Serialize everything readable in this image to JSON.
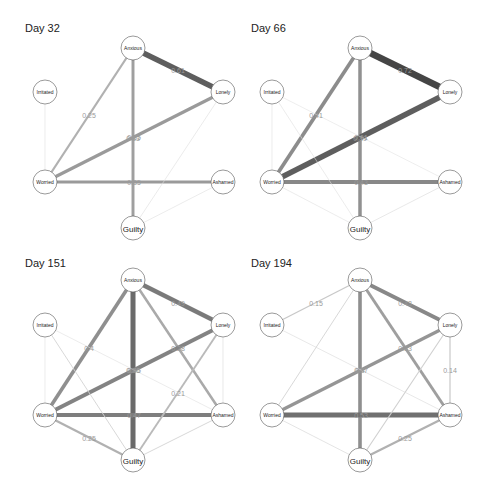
{
  "figure": {
    "panels": [
      {
        "title": "Day 32",
        "nodes": [
          "Anxious",
          "Lonely",
          "Irritated",
          "Worried",
          "Ashamed",
          "Guilty"
        ],
        "edges": [
          {
            "from": "Anxious",
            "to": "Lonely",
            "weight": 0.61,
            "label": "0.61"
          },
          {
            "from": "Anxious",
            "to": "Worried",
            "weight": 0.25,
            "label": "0.25"
          },
          {
            "from": "Anxious",
            "to": "Guilty",
            "weight": 0.33,
            "label": "0.33"
          },
          {
            "from": "Worried",
            "to": "Lonely",
            "weight": 0.35,
            "label": "0.35"
          },
          {
            "from": "Worried",
            "to": "Ashamed",
            "weight": 0.35,
            "label": "0.35"
          },
          {
            "from": "Irritated",
            "to": "Worried",
            "weight": 0.05,
            "label": ""
          },
          {
            "from": "Lonely",
            "to": "Guilty",
            "weight": 0.06,
            "label": ""
          },
          {
            "from": "Ashamed",
            "to": "Guilty",
            "weight": 0.05,
            "label": ""
          }
        ]
      },
      {
        "title": "Day 66",
        "nodes": [
          "Anxious",
          "Lonely",
          "Irritated",
          "Worried",
          "Ashamed",
          "Guilty"
        ],
        "edges": [
          {
            "from": "Anxious",
            "to": "Lonely",
            "weight": 0.72,
            "label": "0.72"
          },
          {
            "from": "Anxious",
            "to": "Worried",
            "weight": 0.41,
            "label": "0.41"
          },
          {
            "from": "Anxious",
            "to": "Guilty",
            "weight": 0.39,
            "label": "0.39"
          },
          {
            "from": "Worried",
            "to": "Lonely",
            "weight": 0.61,
            "label": "0.61"
          },
          {
            "from": "Worried",
            "to": "Ashamed",
            "weight": 0.43,
            "label": "0.43"
          },
          {
            "from": "Irritated",
            "to": "Worried",
            "weight": 0.05,
            "label": ""
          },
          {
            "from": "Irritated",
            "to": "Guilty",
            "weight": 0.05,
            "label": ""
          },
          {
            "from": "Irritated",
            "to": "Ashamed",
            "weight": 0.04,
            "label": ""
          },
          {
            "from": "Worried",
            "to": "Guilty",
            "weight": 0.05,
            "label": ""
          },
          {
            "from": "Ashamed",
            "to": "Guilty",
            "weight": 0.07,
            "label": ""
          }
        ]
      },
      {
        "title": "Day 151",
        "nodes": [
          "Anxious",
          "Lonely",
          "Irritated",
          "Worried",
          "Ashamed",
          "Guilty"
        ],
        "edges": [
          {
            "from": "Anxious",
            "to": "Lonely",
            "weight": 0.49,
            "label": "0.49"
          },
          {
            "from": "Anxious",
            "to": "Worried",
            "weight": 0.4,
            "label": "0.4"
          },
          {
            "from": "Anxious",
            "to": "Guilty",
            "weight": 0.56,
            "label": "0.56"
          },
          {
            "from": "Anxious",
            "to": "Ashamed",
            "weight": 0.28,
            "label": "0.28"
          },
          {
            "from": "Worried",
            "to": "Lonely",
            "weight": 0.45,
            "label": "0.45"
          },
          {
            "from": "Worried",
            "to": "Ashamed",
            "weight": 0.47,
            "label": "0.47"
          },
          {
            "from": "Worried",
            "to": "Guilty",
            "weight": 0.25,
            "label": "0.25"
          },
          {
            "from": "Lonely",
            "to": "Guilty",
            "weight": 0.21,
            "label": "0.21"
          },
          {
            "from": "Irritated",
            "to": "Worried",
            "weight": 0.05,
            "label": ""
          },
          {
            "from": "Irritated",
            "to": "Guilty",
            "weight": 0.1,
            "label": ""
          },
          {
            "from": "Irritated",
            "to": "Ashamed",
            "weight": 0.05,
            "label": ""
          },
          {
            "from": "Lonely",
            "to": "Ashamed",
            "weight": 0.07,
            "label": ""
          },
          {
            "from": "Ashamed",
            "to": "Guilty",
            "weight": 0.1,
            "label": ""
          }
        ]
      },
      {
        "title": "Day 194",
        "nodes": [
          "Anxious",
          "Lonely",
          "Irritated",
          "Worried",
          "Ashamed",
          "Guilty"
        ],
        "edges": [
          {
            "from": "Anxious",
            "to": "Lonely",
            "weight": 0.43,
            "label": "0.43"
          },
          {
            "from": "Anxious",
            "to": "Guilty",
            "weight": 0.4,
            "label": "0.4"
          },
          {
            "from": "Anxious",
            "to": "Ashamed",
            "weight": 0.33,
            "label": "0.33"
          },
          {
            "from": "Anxious",
            "to": "Irritated",
            "weight": 0.15,
            "label": "0.15"
          },
          {
            "from": "Anxious",
            "to": "Worried",
            "weight": 0.1,
            "label": ""
          },
          {
            "from": "Worried",
            "to": "Lonely",
            "weight": 0.37,
            "label": "0.37"
          },
          {
            "from": "Worried",
            "to": "Ashamed",
            "weight": 0.53,
            "label": "0.53"
          },
          {
            "from": "Lonely",
            "to": "Ashamed",
            "weight": 0.14,
            "label": "0.14"
          },
          {
            "from": "Lonely",
            "to": "Guilty",
            "weight": 0.12,
            "label": ""
          },
          {
            "from": "Ashamed",
            "to": "Guilty",
            "weight": 0.25,
            "label": "0.25"
          },
          {
            "from": "Irritated",
            "to": "Ashamed",
            "weight": 0.07,
            "label": ""
          },
          {
            "from": "Worried",
            "to": "Guilty",
            "weight": 0.08,
            "label": ""
          }
        ]
      }
    ]
  },
  "chart_data": {
    "type": "network",
    "panel_titles": [
      "Day 32",
      "Day 66",
      "Day 151",
      "Day 194"
    ],
    "node_labels": [
      "Anxious",
      "Lonely",
      "Irritated",
      "Worried",
      "Ashamed",
      "Guilty"
    ]
  }
}
